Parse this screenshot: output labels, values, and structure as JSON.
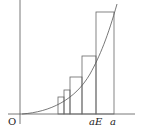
{
  "figure": {
    "labels": {
      "origin": "O",
      "partition_point": "aE",
      "endpoint": "a"
    },
    "colors": {
      "stroke": "#555555",
      "background": "#ffffff"
    },
    "rectangle_count": 5
  }
}
